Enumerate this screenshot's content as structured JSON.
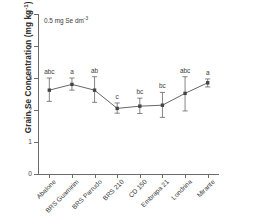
{
  "chart_data": {
    "type": "line",
    "title": "",
    "xlabel": "",
    "ylabel": "Grain Se Concentration (mg kg",
    "ylabel_sup": "-1",
    "ylabel_tail": ")",
    "annotation": "0.5 mg Se dm",
    "annotation_sup": "-3",
    "ylim": [
      0,
      5
    ],
    "yticks": [
      0,
      1,
      2,
      3,
      4,
      5
    ],
    "ytick_labels": [
      "0",
      "1",
      "2",
      "3",
      "4",
      "5"
    ],
    "grid": false,
    "legend": "none",
    "categories": [
      "Abalone",
      "BRS Guamirim",
      "BRS Parrudo",
      "BRS 210",
      "CD 150",
      "Embrapa 21",
      "Londrina",
      "Mirante"
    ],
    "values": [
      2.62,
      2.8,
      2.62,
      2.05,
      2.12,
      2.15,
      2.52,
      2.85
    ],
    "error_low": [
      0.35,
      0.18,
      0.38,
      0.15,
      0.23,
      0.38,
      0.55,
      0.13
    ],
    "error_high": [
      0.38,
      0.2,
      0.42,
      0.17,
      0.25,
      0.4,
      0.52,
      0.12
    ],
    "significance_letters": [
      "abc",
      "a",
      "ab",
      "c",
      "bc",
      "bc",
      "abc",
      "a"
    ],
    "line_color": "#555555",
    "marker_color": "#444444",
    "error_color": "#666666",
    "axis_color": "#6b6b6b"
  }
}
